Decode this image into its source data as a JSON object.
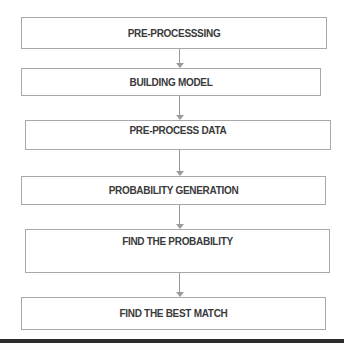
{
  "diagram": {
    "type": "flowchart",
    "direction": "top-to-bottom",
    "steps": [
      {
        "label": "PRE-PROCESSSING"
      },
      {
        "label": "BUILDING MODEL"
      },
      {
        "label": "PRE-PROCESS DATA"
      },
      {
        "label": "PROBABILITY GENERATION"
      },
      {
        "label": "FIND THE PROBABILITY"
      },
      {
        "label": "FIND THE BEST MATCH"
      }
    ],
    "connectors": [
      {
        "from": 0,
        "to": 1
      },
      {
        "from": 1,
        "to": 2
      },
      {
        "from": 2,
        "to": 3
      },
      {
        "from": 3,
        "to": 4
      },
      {
        "from": 4,
        "to": 5
      }
    ],
    "colors": {
      "box_border": "#a8a8a8",
      "text": "#3a3a3a",
      "arrow": "#9a9a9a",
      "bottom_rule": "#2c2c2c"
    }
  }
}
